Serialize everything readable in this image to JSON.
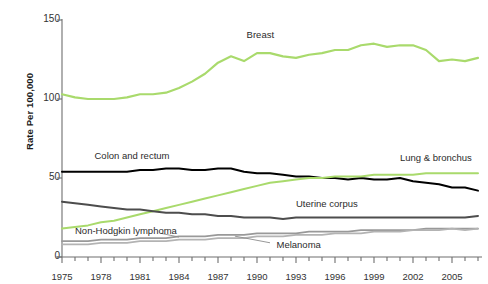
{
  "chart_data": {
    "type": "line",
    "title": "",
    "xlabel": "",
    "ylabel": "Rate Per 100,000",
    "xlim": [
      1975,
      2007
    ],
    "ylim": [
      0,
      150
    ],
    "yticks": [
      0,
      50,
      100,
      150
    ],
    "xticks": [
      1975,
      1978,
      1981,
      1984,
      1987,
      1990,
      1993,
      1996,
      1999,
      2002,
      2005
    ],
    "xtick_minor_step": 1,
    "grid": false,
    "legend": "inline-annotations",
    "x": [
      1975,
      1976,
      1977,
      1978,
      1979,
      1980,
      1981,
      1982,
      1983,
      1984,
      1985,
      1986,
      1987,
      1988,
      1989,
      1990,
      1991,
      1992,
      1993,
      1994,
      1995,
      1996,
      1997,
      1998,
      1999,
      2000,
      2001,
      2002,
      2003,
      2004,
      2005,
      2006,
      2007
    ],
    "series": [
      {
        "name": "Breast",
        "color": "#a9da6c",
        "width": 2.2,
        "label_x": 1989.2,
        "label_y": 140,
        "values": [
          103,
          101,
          100,
          100,
          100,
          101,
          103,
          103,
          104,
          107,
          111,
          116,
          123,
          127,
          124,
          129,
          129,
          127,
          126,
          128,
          129,
          131,
          131,
          134,
          135,
          133,
          134,
          134,
          131,
          124,
          125,
          124,
          126
        ]
      },
      {
        "name": "Colon and rectum",
        "color": "#000000",
        "width": 2.0,
        "label_x": 1977.5,
        "label_y": 63,
        "values": [
          54,
          54,
          54,
          54,
          54,
          54,
          55,
          55,
          56,
          56,
          55,
          55,
          56,
          56,
          54,
          53,
          53,
          52,
          51,
          51,
          50,
          50,
          49,
          50,
          49,
          49,
          50,
          48,
          47,
          46,
          44,
          44,
          42
        ]
      },
      {
        "name": "Lung & bronchus",
        "color": "#a9da6c",
        "width": 2.0,
        "label_x": 2001.0,
        "label_y": 62,
        "values": [
          18,
          19,
          20,
          22,
          23,
          25,
          27,
          29,
          31,
          33,
          35,
          37,
          39,
          41,
          43,
          45,
          47,
          48,
          49,
          50,
          50,
          51,
          51,
          51,
          52,
          52,
          52,
          52,
          53,
          53,
          53,
          53,
          53
        ]
      },
      {
        "name": "Uterine corpus",
        "color": "#4d4d4d",
        "width": 2.0,
        "label_x": 1993.0,
        "label_y": 33,
        "values": [
          35,
          34,
          33,
          32,
          31,
          30,
          30,
          29,
          28,
          28,
          27,
          27,
          26,
          26,
          25,
          25,
          25,
          24,
          25,
          25,
          25,
          25,
          25,
          25,
          25,
          25,
          25,
          25,
          25,
          25,
          25,
          25,
          26
        ]
      },
      {
        "name": "Non-Hodgkin lymphoma",
        "color": "#999999",
        "width": 1.8,
        "label_x": 1976.0,
        "label_y": 16,
        "values": [
          10,
          10,
          10,
          11,
          11,
          11,
          12,
          12,
          12,
          13,
          13,
          13,
          14,
          14,
          14,
          15,
          15,
          15,
          15,
          16,
          16,
          16,
          16,
          17,
          17,
          17,
          17,
          17,
          18,
          18,
          18,
          18,
          18
        ]
      },
      {
        "name": "Melanoma",
        "color": "#b3b3b3",
        "width": 1.8,
        "label_x": 1991.5,
        "label_y": 7,
        "values": [
          8,
          8,
          8,
          9,
          9,
          9,
          10,
          10,
          10,
          11,
          11,
          11,
          12,
          12,
          12,
          13,
          13,
          13,
          14,
          14,
          14,
          15,
          15,
          15,
          16,
          16,
          16,
          17,
          17,
          17,
          18,
          17,
          18
        ]
      }
    ]
  },
  "axis": {
    "ytick_labels": [
      "0",
      "50",
      "100",
      "150"
    ],
    "xtick_labels": [
      "1975",
      "1978",
      "1981",
      "1984",
      "1987",
      "1990",
      "1993",
      "1996",
      "1999",
      "2002",
      "2005"
    ],
    "y_axis_title": "Rate Per 100,000"
  },
  "annotations": {
    "breast": "Breast",
    "colon_and_rectum": "Colon and rectum",
    "lung_and_bronchus": "Lung & bronchus",
    "uterine_corpus": "Uterine corpus",
    "non_hodgkin_lymphoma": "Non-Hodgkin lymphoma",
    "melanoma": "Melanoma"
  }
}
